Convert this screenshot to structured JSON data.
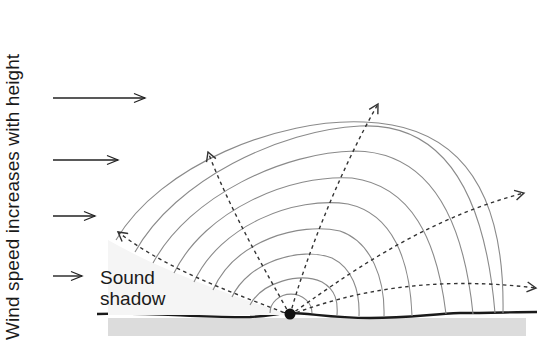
{
  "diagram": {
    "vertical_label": "Wind speed increases with height",
    "shadow_label_line1": "Sound",
    "shadow_label_line2": "shadow",
    "colors": {
      "background": "#ffffff",
      "ground_line": "#1a1a1a",
      "ground_fill": "#dcdcdc",
      "wavefront": "#8a8a8a",
      "ray": "#333333",
      "text": "#1a1a1a"
    },
    "source": {
      "x": 290,
      "y": 315,
      "label": "sound-source"
    },
    "wind_arrows": [
      {
        "y": 98,
        "x1": 53,
        "x2": 145
      },
      {
        "y": 160,
        "x1": 53,
        "x2": 118
      },
      {
        "y": 216,
        "x1": 53,
        "x2": 95
      },
      {
        "y": 276,
        "x1": 53,
        "x2": 82
      }
    ],
    "wavefront_count": 9,
    "ray_count": 5
  }
}
